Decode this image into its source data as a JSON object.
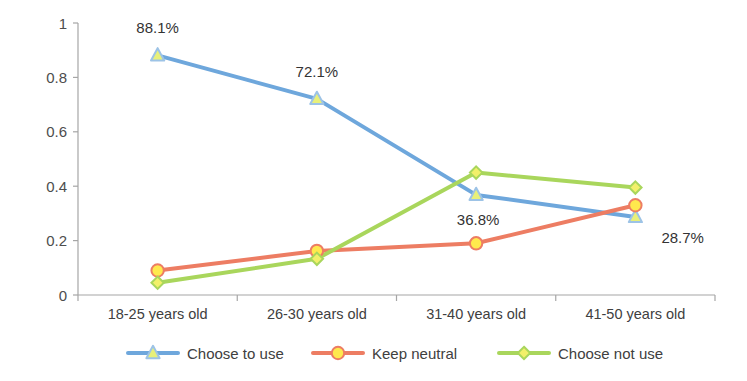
{
  "chart_data": {
    "type": "line",
    "title": "",
    "xlabel": "",
    "ylabel": "",
    "categories": [
      "18-25 years old",
      "26-30 years old",
      "31-40 years old",
      "41-50 years old"
    ],
    "ylim": [
      0,
      1
    ],
    "yticks": [
      "0",
      "0.2",
      "0.4",
      "0.6",
      "0.8",
      "1"
    ],
    "ytick_values": [
      0,
      0.2,
      0.4,
      0.6,
      0.8,
      1
    ],
    "grid": false,
    "legend_position": "bottom",
    "series": [
      {
        "name": "Choose to use",
        "color": "#6EA7DC",
        "marker": "triangle",
        "marker_fill": "#E8F07A",
        "marker_stroke": "#9DC3E6",
        "values": [
          0.881,
          0.721,
          0.368,
          0.287
        ],
        "labels": [
          "88.1%",
          "72.1%",
          "36.8%",
          "28.7%"
        ]
      },
      {
        "name": "Keep neutral",
        "color": "#ED7D63",
        "marker": "circle",
        "marker_fill": "#FFE94D",
        "marker_stroke": "#ED7D63",
        "values": [
          0.09,
          0.162,
          0.19,
          0.33
        ],
        "labels": [
          "",
          "",
          "",
          ""
        ]
      },
      {
        "name": "Choose not use",
        "color": "#A9D65C",
        "marker": "diamond",
        "marker_fill": "#F2F06A",
        "marker_stroke": "#A9D65C",
        "values": [
          0.045,
          0.133,
          0.45,
          0.395
        ],
        "labels": [
          "",
          "",
          "",
          ""
        ]
      }
    ],
    "data_labels": [
      {
        "text": "88.1%",
        "series": "Choose to use",
        "category": "18-25 years old"
      },
      {
        "text": "72.1%",
        "series": "Choose to use",
        "category": "26-30 years old"
      },
      {
        "text": "36.8%",
        "series": "Choose to use",
        "category": "31-40 years old"
      },
      {
        "text": "28.7%",
        "series": "Choose to use",
        "category": "41-50 years old"
      }
    ],
    "axis_color": "#A6A6A6"
  }
}
